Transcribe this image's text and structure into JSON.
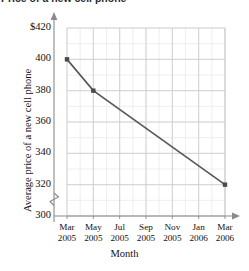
{
  "header": {
    "truncated_text": "Price of a new cell phone"
  },
  "chart_data": {
    "type": "line",
    "title": "",
    "xlabel": "Month",
    "ylabel": "Average price of a new cell phone",
    "categories": [
      "Mar 2005",
      "May 2005",
      "Jul 2005",
      "Sep 2005",
      "Nov 2005",
      "Jan 2006",
      "Mar 2006"
    ],
    "x_tick_lines": [
      {
        "top": "Mar",
        "bottom": "2005"
      },
      {
        "top": "May",
        "bottom": "2005"
      },
      {
        "top": "Jul",
        "bottom": "2005"
      },
      {
        "top": "Sep",
        "bottom": "2005"
      },
      {
        "top": "Nov",
        "bottom": "2005"
      },
      {
        "top": "Jan",
        "bottom": "2006"
      },
      {
        "top": "Mar",
        "bottom": "2006"
      }
    ],
    "y_tick_labels": [
      "$420",
      "400",
      "380",
      "360",
      "340",
      "320",
      "300"
    ],
    "y_tick_values": [
      420,
      400,
      380,
      360,
      340,
      320,
      300
    ],
    "ylim": [
      300,
      420
    ],
    "y_major_step": 20,
    "y_minor_step": 10,
    "x_minor_step_months": 1,
    "y_axis_break": true,
    "grid": true,
    "legend": "none",
    "series": [
      {
        "name": "Average price of a new cell phone",
        "points": [
          {
            "x": "Mar 2005",
            "y": 400,
            "marker": true
          },
          {
            "x": "May 2005",
            "y": 380,
            "marker": true
          },
          {
            "x": "Mar 2006",
            "y": 320,
            "marker": true
          }
        ],
        "line_color": "#5a5a5a",
        "marker_color": "#4a4a4a"
      }
    ],
    "colors": {
      "grid_major": "#cfcfd6",
      "grid_minor": "#e6e6ec",
      "axis": "#8a8a8a",
      "line": "#5a5a5a",
      "marker": "#4a4a4a"
    }
  }
}
